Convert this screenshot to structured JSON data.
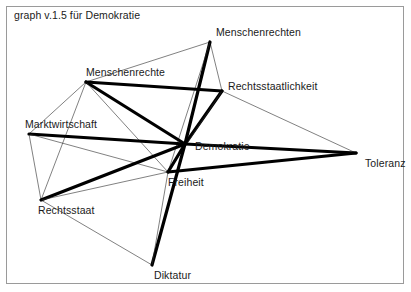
{
  "window": {
    "title": "graph v.1.5 für Demokratie",
    "width": 411,
    "height": 292,
    "background_color": "#ffffff",
    "border_color": "#9a9a9a"
  },
  "graph_data": {
    "type": "node-link-diagram",
    "title": "graph v.1.5 für Demokratie",
    "edge_colors": {
      "thin": "#2b2b2b",
      "thick": "#000000"
    },
    "edge_widths": {
      "thin": 0.6,
      "medium": 1.6,
      "thick": 3.2
    },
    "nodes": [
      {
        "id": "menschenrechten",
        "label": "Menschenrechten",
        "x": 210,
        "y": 42,
        "label_dx": 6,
        "label_dy": -16
      },
      {
        "id": "menschenrechte",
        "label": "Menschenrechte",
        "x": 86,
        "y": 82,
        "label_dx": 0,
        "label_dy": -16
      },
      {
        "id": "rechtsstaatlichkeit",
        "label": "Rechtsstaatlichkeit",
        "x": 222,
        "y": 91,
        "label_dx": 6,
        "label_dy": -11
      },
      {
        "id": "marktwirtschaft",
        "label": "Marktwirtschaft",
        "x": 29,
        "y": 134,
        "label_dx": -4,
        "label_dy": -16
      },
      {
        "id": "demokratie",
        "label": "Demokratie",
        "x": 185,
        "y": 144,
        "label_dx": 10,
        "label_dy": -4
      },
      {
        "id": "toleranz",
        "label": "Toleranz",
        "x": 356,
        "y": 153,
        "label_dx": 9,
        "label_dy": 4
      },
      {
        "id": "freiheit",
        "label": "Freiheit",
        "x": 168,
        "y": 172,
        "label_dx": 0,
        "label_dy": 4
      },
      {
        "id": "rechtsstaat",
        "label": "Rechtsstaat",
        "x": 41,
        "y": 200,
        "label_dx": -3,
        "label_dy": 4
      },
      {
        "id": "diktatur",
        "label": "Diktatur",
        "x": 152,
        "y": 265,
        "label_dx": 2,
        "label_dy": 4
      }
    ],
    "edges": [
      {
        "source": "menschenrechten",
        "target": "menschenrechte",
        "weight": "thin"
      },
      {
        "source": "menschenrechten",
        "target": "rechtsstaatlichkeit",
        "weight": "thin"
      },
      {
        "source": "menschenrechten",
        "target": "demokratie",
        "weight": "thick"
      },
      {
        "source": "menschenrechten",
        "target": "freiheit",
        "weight": "thin"
      },
      {
        "source": "menschenrechte",
        "target": "rechtsstaatlichkeit",
        "weight": "thick"
      },
      {
        "source": "menschenrechte",
        "target": "demokratie",
        "weight": "thick"
      },
      {
        "source": "menschenrechte",
        "target": "marktwirtschaft",
        "weight": "thin"
      },
      {
        "source": "menschenrechte",
        "target": "freiheit",
        "weight": "thin"
      },
      {
        "source": "menschenrechte",
        "target": "rechtsstaat",
        "weight": "thin"
      },
      {
        "source": "rechtsstaatlichkeit",
        "target": "demokratie",
        "weight": "thick"
      },
      {
        "source": "rechtsstaatlichkeit",
        "target": "freiheit",
        "weight": "thin"
      },
      {
        "source": "rechtsstaatlichkeit",
        "target": "toleranz",
        "weight": "thin"
      },
      {
        "source": "marktwirtschaft",
        "target": "demokratie",
        "weight": "thick"
      },
      {
        "source": "marktwirtschaft",
        "target": "freiheit",
        "weight": "thin"
      },
      {
        "source": "marktwirtschaft",
        "target": "rechtsstaat",
        "weight": "thin"
      },
      {
        "source": "demokratie",
        "target": "freiheit",
        "weight": "thick"
      },
      {
        "source": "demokratie",
        "target": "toleranz",
        "weight": "thick"
      },
      {
        "source": "demokratie",
        "target": "rechtsstaat",
        "weight": "thick"
      },
      {
        "source": "demokratie",
        "target": "diktatur",
        "weight": "thick"
      },
      {
        "source": "freiheit",
        "target": "toleranz",
        "weight": "thick"
      },
      {
        "source": "freiheit",
        "target": "rechtsstaat",
        "weight": "thin"
      },
      {
        "source": "freiheit",
        "target": "diktatur",
        "weight": "thin"
      },
      {
        "source": "rechtsstaat",
        "target": "diktatur",
        "weight": "thin"
      }
    ]
  }
}
